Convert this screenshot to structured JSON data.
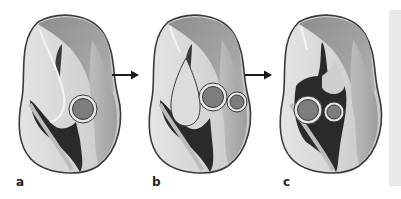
{
  "figure": {
    "panels": [
      {
        "id": "a",
        "label": "a",
        "circles": 1
      },
      {
        "id": "b",
        "label": "b",
        "circles": 2
      },
      {
        "id": "c",
        "label": "c",
        "circles": 2
      }
    ],
    "arrows": [
      {
        "from": "a",
        "to": "b",
        "icon": "right-arrow-icon"
      },
      {
        "from": "b",
        "to": "c",
        "icon": "right-arrow-icon"
      }
    ],
    "colors": {
      "outline": "#3a3a3a",
      "light": "#d9d9d9",
      "mid": "#9a9a9a",
      "dark": "#2a2a2a",
      "circle_fill": "#7d7d7d",
      "circle_ring": "#e6e6e6",
      "side_panel": "#e8e8e8"
    }
  }
}
